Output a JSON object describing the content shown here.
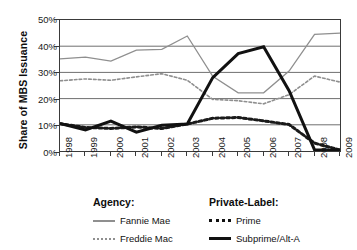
{
  "chart_data": {
    "type": "line",
    "title": "",
    "xlabel": "",
    "ylabel": "Share of MBS Issuance",
    "categories": [
      "1998",
      "1999",
      "2000",
      "2001",
      "2002",
      "2003",
      "2004",
      "2005",
      "2006",
      "2007",
      "2008",
      "2009"
    ],
    "ylim": [
      0,
      50
    ],
    "yticks": [
      0,
      10,
      20,
      30,
      40,
      50
    ],
    "ytick_labels": [
      "0%",
      "10%",
      "20%",
      "30%",
      "40%",
      "50%"
    ],
    "grid": "horizontal",
    "legend_position": "below",
    "series": [
      {
        "name": "Fannie Mae",
        "group": "Agency",
        "style": "solid",
        "color": "#8f8f8f",
        "width": 1.3,
        "values": [
          35.2,
          35.8,
          34.3,
          38.5,
          38.8,
          43.9,
          28.5,
          22.2,
          22.2,
          30.5,
          44.5,
          45.0
        ]
      },
      {
        "name": "Freddie Mac",
        "group": "Agency",
        "style": "dotted",
        "color": "#8f8f8f",
        "width": 1.6,
        "values": [
          26.8,
          27.5,
          27.0,
          28.3,
          29.5,
          27.0,
          19.7,
          19.2,
          18.0,
          21.5,
          28.6,
          26.3
        ]
      },
      {
        "name": "Prime",
        "group": "Private-Label",
        "style": "dotted",
        "color": "#1a1a1a",
        "width": 3.0,
        "values": [
          10.4,
          9.0,
          8.6,
          9.2,
          8.6,
          10.3,
          12.5,
          12.8,
          11.5,
          10.1,
          3.0,
          0.4
        ]
      },
      {
        "name": "Subprime/Alt-A",
        "group": "Private-Label",
        "style": "solid",
        "color": "#111111",
        "width": 3.0,
        "values": [
          10.5,
          8.0,
          11.4,
          7.2,
          9.8,
          10.3,
          28.0,
          37.2,
          39.8,
          23.0,
          0.4,
          0.4
        ]
      }
    ]
  },
  "axis": {
    "ylabel": "Share of MBS Issuance",
    "ytick_labels": [
      "50%",
      "40%",
      "30%",
      "20%",
      "10%",
      "0%"
    ],
    "xtick_labels": [
      "1998",
      "1999",
      "2000",
      "2001",
      "2002",
      "2003",
      "2004",
      "2005",
      "2006",
      "2007",
      "2008",
      "2009"
    ]
  },
  "legend": {
    "groups": [
      {
        "title": "Agency:",
        "entries": [
          {
            "label": "Fannie Mae",
            "swatch": "solid-gray"
          },
          {
            "label": "Freddie Mac",
            "swatch": "dot-gray"
          }
        ]
      },
      {
        "title": "Private-Label:",
        "entries": [
          {
            "label": "Prime",
            "swatch": "dot-black"
          },
          {
            "label": "Subprime/Alt-A",
            "swatch": "solid-black"
          }
        ]
      }
    ]
  }
}
